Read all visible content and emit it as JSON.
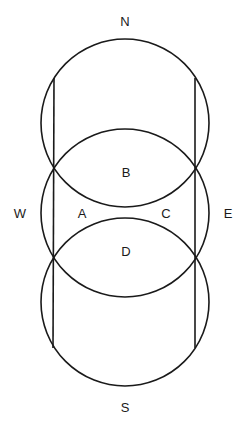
{
  "diagram": {
    "stroke_color": "#1a1a1a",
    "background": "#ffffff",
    "circles": [
      {
        "name": "top-circle",
        "cx": 125,
        "cy": 123,
        "r": 84
      },
      {
        "name": "middle-circle",
        "cx": 125,
        "cy": 213,
        "r": 84
      },
      {
        "name": "bottom-circle",
        "cx": 125,
        "cy": 302,
        "r": 84
      }
    ],
    "lines": [
      {
        "name": "left-vertical-line",
        "x1": 54,
        "y1": 78,
        "x2": 53,
        "y2": 348
      },
      {
        "name": "right-vertical-line",
        "x1": 195,
        "y1": 78,
        "x2": 195,
        "y2": 348
      }
    ],
    "labels": {
      "north": {
        "text": "N",
        "x": 125,
        "y": 21
      },
      "south": {
        "text": "S",
        "x": 125,
        "y": 407
      },
      "west": {
        "text": "W",
        "x": 20,
        "y": 213
      },
      "east": {
        "text": "E",
        "x": 228,
        "y": 213
      },
      "region_a": {
        "text": "A",
        "x": 82,
        "y": 213
      },
      "region_b": {
        "text": "B",
        "x": 126,
        "y": 172
      },
      "region_c": {
        "text": "C",
        "x": 166,
        "y": 213
      },
      "region_d": {
        "text": "D",
        "x": 126,
        "y": 251
      }
    }
  }
}
